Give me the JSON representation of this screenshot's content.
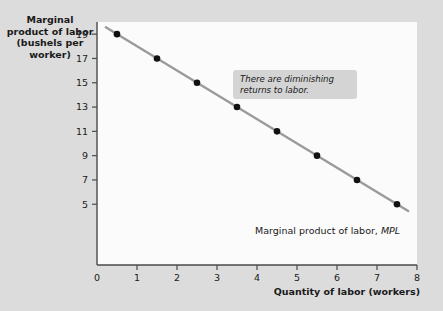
{
  "chart_data": {
    "type": "line",
    "title": "",
    "xlabel": "Quantity of labor (workers)",
    "ylabel": "Marginal product of labor (bushels per worker)",
    "ylabel_lines": [
      "Marginal",
      "product of labor",
      "(bushels per",
      "worker)"
    ],
    "xlim": [
      0,
      8
    ],
    "ylim": [
      0,
      20
    ],
    "xticks": [
      "0",
      "1",
      "2",
      "3",
      "4",
      "5",
      "6",
      "7",
      "8"
    ],
    "xtick_values": [
      0,
      1,
      2,
      3,
      4,
      5,
      6,
      7,
      8
    ],
    "yticks": [
      "19",
      "17",
      "15",
      "13",
      "11",
      "9",
      "7",
      "5"
    ],
    "ytick_values": [
      19,
      17,
      15,
      13,
      11,
      9,
      7,
      5
    ],
    "grid": false,
    "legend": "none",
    "series": [
      {
        "name": "Marginal product of labor, MPL",
        "x": [
          0.5,
          1.5,
          2.5,
          3.5,
          4.5,
          5.5,
          6.5,
          7.5
        ],
        "values": [
          19,
          17,
          15,
          13,
          11,
          9,
          7,
          5
        ],
        "line_color": "#9a9a9a",
        "marker_color": "#111111"
      }
    ],
    "annotations": [
      {
        "name": "diminishing-returns-note",
        "text_lines": [
          "There are diminishing",
          "returns to labor."
        ],
        "text": "There are diminishing returns to labor.",
        "box_color": "#d4d4d4"
      },
      {
        "name": "curve-label",
        "text_plain": "Marginal product of labor,",
        "text_italic": "MPL",
        "text": "Marginal product of labor, MPL"
      }
    ],
    "colors": {
      "background": "#dcdcdc",
      "plot_background": "#fbfbfb",
      "axis": "#4a4a4a",
      "text": "#1a1a1a",
      "line": "#9a9a9a",
      "marker": "#111111",
      "annotation_box": "#d4d4d4"
    }
  }
}
